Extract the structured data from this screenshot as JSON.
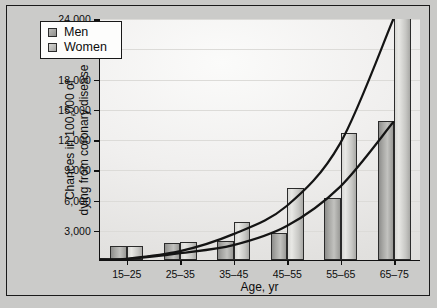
{
  "chart_data": {
    "type": "bar",
    "title": "",
    "xlabel": "Age, yr",
    "ylabel": "Chances in 100,000 of dying from coronary disease",
    "ylabel_line1": "Chances in 100,000 of",
    "ylabel_line2": "dying from coronary disease",
    "categories": [
      "15–25",
      "25–35",
      "35–45",
      "45–55",
      "55–65",
      "65–75"
    ],
    "ylim": [
      0,
      24000
    ],
    "yticks": [
      3000,
      6000,
      9000,
      12000,
      15000,
      18000,
      21000,
      24000
    ],
    "ytick_labels": [
      "3,000",
      "6,000",
      "9,000",
      "12,000",
      "15,000",
      "18,000",
      "21,000",
      "24,000"
    ],
    "grid": true,
    "legend_position": "top-left",
    "series": [
      {
        "name": "Men",
        "color": "#a8a8a5",
        "values": [
          1400,
          1700,
          1850,
          2700,
          6150,
          13750
        ]
      },
      {
        "name": "Women",
        "color": "#dcdcd9",
        "values": [
          1400,
          1750,
          3750,
          7100,
          12550,
          24000
        ]
      }
    ],
    "overlay_curves": [
      {
        "name": "Women trend curve",
        "points": [
          [
            0,
            150
          ],
          [
            1,
            900
          ],
          [
            2,
            2600
          ],
          [
            3,
            5400
          ],
          [
            4,
            11600
          ],
          [
            5,
            24000
          ]
        ]
      },
      {
        "name": "Men trend curve",
        "points": [
          [
            0,
            120
          ],
          [
            1,
            700
          ],
          [
            2,
            1500
          ],
          [
            3,
            3400
          ],
          [
            4,
            7300
          ],
          [
            5,
            13750
          ]
        ]
      }
    ]
  },
  "legend": {
    "items": [
      {
        "label": "Men",
        "swatch": "men-swatch"
      },
      {
        "label": "Women",
        "swatch": "women-swatch"
      }
    ]
  }
}
